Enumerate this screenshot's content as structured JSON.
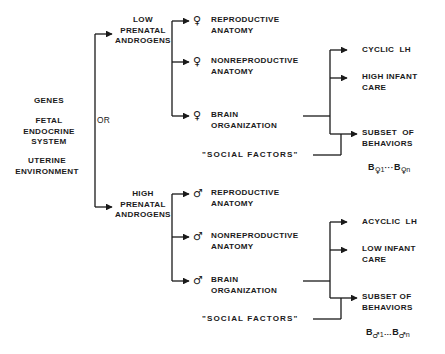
{
  "diagram": {
    "inputs": [
      {
        "label": "GENES"
      },
      {
        "label": "FETAL\nENDOCRINE\nSYSTEM"
      },
      {
        "label": "UTERINE\nENVIRONMENT"
      }
    ],
    "operator": "OR",
    "branches": [
      {
        "condition": "LOW\nPRENATAL\nANDROGENS",
        "sex_symbol": "♀",
        "outcomes": [
          {
            "symbol": "♀",
            "label": "REPRODUCTIVE\nANATOMY"
          },
          {
            "symbol": "♀",
            "label": "NONREPRODUCTIVE\nANATOMY"
          },
          {
            "symbol": "♀",
            "label": "BRAIN\nORGANIZATION"
          }
        ],
        "modifier": "\"SOCIAL FACTORS\"",
        "results": [
          {
            "label": "CYCLIC  LH"
          },
          {
            "label": "HIGH INFANT\nCARE"
          },
          {
            "label": "SUBSET  OF\nBEHAVIORS"
          }
        ],
        "behavior_set": {
          "base": "B",
          "symbol": "♀",
          "first_index": "1",
          "ellipsis": "···",
          "last_index": "n"
        }
      },
      {
        "condition": "HIGH\nPRENATAL\nANDROGENS",
        "sex_symbol": "♂",
        "outcomes": [
          {
            "symbol": "♂",
            "label": "REPRODUCTIVE\nANATOMY"
          },
          {
            "symbol": "♂",
            "label": "NONREPRODUCTIVE\nANATOMY"
          },
          {
            "symbol": "♂",
            "label": "BRAIN\nORGANIZATION"
          }
        ],
        "modifier": "\"SOCIAL FACTORS\"",
        "results": [
          {
            "label": "ACYCLIC  LH"
          },
          {
            "label": "LOW INFANT\nCARE"
          },
          {
            "label": "SUBSET OF\nBEHAVIORS"
          }
        ],
        "behavior_set": {
          "base": "B",
          "symbol": "♂",
          "first_index": "1",
          "ellipsis": "…",
          "last_index": "n"
        }
      }
    ],
    "colors": {
      "ink": "#1a1a1a",
      "background": "#ffffff"
    }
  }
}
